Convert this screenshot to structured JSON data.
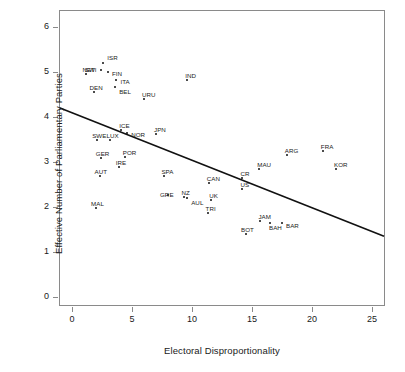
{
  "chart_data": {
    "type": "scatter",
    "title": "",
    "xlabel": "Electoral Disproportionality",
    "ylabel": "Effective Number of Parliamentary Parties",
    "xlim": [
      -1,
      26
    ],
    "ylim": [
      -0.3,
      6.3
    ],
    "xticks": [
      0,
      5,
      10,
      15,
      20,
      25
    ],
    "yticks": [
      0,
      1,
      2,
      3,
      4,
      5,
      6
    ],
    "grid": false,
    "legend": null,
    "points": [
      {
        "label": "ISR",
        "x": 2.6,
        "y": 5.2,
        "lx": 4,
        "ly": -9
      },
      {
        "label": "SWI",
        "x": 2.4,
        "y": 5.05,
        "lx": -16,
        "ly": -4
      },
      {
        "label": "NET",
        "x": 1.2,
        "y": 4.95,
        "lx": -4,
        "ly": -8
      },
      {
        "label": "FIN",
        "x": 3.0,
        "y": 5.0,
        "lx": 4,
        "ly": -2
      },
      {
        "label": "ITA",
        "x": 3.7,
        "y": 4.82,
        "lx": 4,
        "ly": -2
      },
      {
        "label": "BEL",
        "x": 3.6,
        "y": 4.67,
        "lx": 4,
        "ly": 1
      },
      {
        "label": "DEN",
        "x": 1.8,
        "y": 4.55,
        "lx": -4,
        "ly": -8
      },
      {
        "label": "URU",
        "x": 6.0,
        "y": 4.4,
        "lx": -2,
        "ly": -8
      },
      {
        "label": "IND",
        "x": 9.6,
        "y": 4.82,
        "lx": -2,
        "ly": -8
      },
      {
        "label": "ICE",
        "x": 4.1,
        "y": 3.72,
        "lx": -2,
        "ly": -8
      },
      {
        "label": "NOR",
        "x": 4.6,
        "y": 3.65,
        "lx": 4,
        "ly": -2
      },
      {
        "label": "JPN",
        "x": 7.0,
        "y": 3.63,
        "lx": -2,
        "ly": -8
      },
      {
        "label": "SWE",
        "x": 2.1,
        "y": 3.48,
        "lx": -5,
        "ly": -8
      },
      {
        "label": "LUX",
        "x": 3.2,
        "y": 3.5,
        "lx": -4,
        "ly": -8
      },
      {
        "label": "POR",
        "x": 4.4,
        "y": 3.12,
        "lx": -2,
        "ly": -8
      },
      {
        "label": "GER",
        "x": 2.4,
        "y": 3.08,
        "lx": -5,
        "ly": -8
      },
      {
        "label": "IRE",
        "x": 3.9,
        "y": 2.9,
        "lx": -3,
        "ly": -8
      },
      {
        "label": "AUT",
        "x": 2.3,
        "y": 2.68,
        "lx": -5,
        "ly": -8
      },
      {
        "label": "SPA",
        "x": 7.7,
        "y": 2.7,
        "lx": -3,
        "ly": -8
      },
      {
        "label": "MAL",
        "x": 2.0,
        "y": 1.98,
        "lx": -5,
        "ly": -8
      },
      {
        "label": "GRE",
        "x": 8.0,
        "y": 2.27,
        "lx": -8,
        "ly": -4
      },
      {
        "label": "NZ",
        "x": 9.3,
        "y": 2.23,
        "lx": -2,
        "ly": -8
      },
      {
        "label": "AUL",
        "x": 9.6,
        "y": 2.2,
        "lx": 4,
        "ly": 1
      },
      {
        "label": "UK",
        "x": 11.6,
        "y": 2.15,
        "lx": -2,
        "ly": -8
      },
      {
        "label": "CAN",
        "x": 11.4,
        "y": 2.53,
        "lx": -2,
        "ly": -8
      },
      {
        "label": "TRI",
        "x": 11.3,
        "y": 1.87,
        "lx": -2,
        "ly": -8
      },
      {
        "label": "CR",
        "x": 14.2,
        "y": 2.65,
        "lx": -2,
        "ly": -8
      },
      {
        "label": "US",
        "x": 14.2,
        "y": 2.4,
        "lx": -2,
        "ly": -8
      },
      {
        "label": "MAU",
        "x": 15.6,
        "y": 2.85,
        "lx": -2,
        "ly": -8
      },
      {
        "label": "ARG",
        "x": 17.9,
        "y": 3.15,
        "lx": -2,
        "ly": -8
      },
      {
        "label": "FRA",
        "x": 20.9,
        "y": 3.25,
        "lx": -2,
        "ly": -8
      },
      {
        "label": "KOR",
        "x": 22.0,
        "y": 2.85,
        "lx": -2,
        "ly": -8
      },
      {
        "label": "BOT",
        "x": 14.5,
        "y": 1.4,
        "lx": -5,
        "ly": -8
      },
      {
        "label": "JAM",
        "x": 15.7,
        "y": 1.68,
        "lx": -2,
        "ly": -8
      },
      {
        "label": "BAH",
        "x": 16.5,
        "y": 1.64,
        "lx": -1,
        "ly": 1
      },
      {
        "label": "BAR",
        "x": 17.5,
        "y": 1.65,
        "lx": 4,
        "ly": -1
      }
    ],
    "trendline": {
      "name": "regression-line",
      "x_start": -1,
      "y_start": 4.2,
      "x_end": 26,
      "y_end": 1.35,
      "color": "#111111"
    }
  },
  "axes": {
    "x_tick_labels": [
      "0",
      "5",
      "10",
      "15",
      "20",
      "25"
    ],
    "y_tick_labels": [
      "0",
      "1",
      "2",
      "3",
      "4",
      "5",
      "6"
    ]
  }
}
